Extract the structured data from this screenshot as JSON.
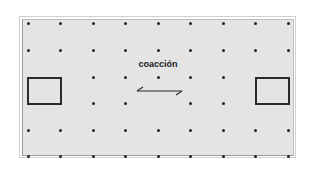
{
  "diagram": {
    "label": "coacción",
    "grid": {
      "columns_x": [
        28,
        60,
        93,
        125,
        158,
        190,
        223,
        255,
        288
      ],
      "rows_y": [
        23,
        50,
        77,
        103,
        130,
        156
      ],
      "dot_color": "#222222"
    },
    "hidden_dots": [
      {
        "col": 0,
        "row": 2
      },
      {
        "col": 1,
        "row": 2
      },
      {
        "col": 0,
        "row": 3
      },
      {
        "col": 1,
        "row": 3
      },
      {
        "col": 7,
        "row": 2
      },
      {
        "col": 8,
        "row": 2
      },
      {
        "col": 7,
        "row": 3
      },
      {
        "col": 8,
        "row": 3
      },
      {
        "col": 4,
        "row": 3
      }
    ],
    "boxes": [
      {
        "name": "left-box",
        "x": 27,
        "y": 77,
        "w": 34,
        "h": 27
      },
      {
        "name": "right-box",
        "x": 255,
        "y": 77,
        "w": 34,
        "h": 27
      }
    ],
    "arrow": {
      "x1": 137,
      "x2": 182,
      "y": 92,
      "type": "double-half-head"
    },
    "colors": {
      "panel_bg": "#e4e4e4",
      "stroke": "#2a2a2a"
    }
  }
}
